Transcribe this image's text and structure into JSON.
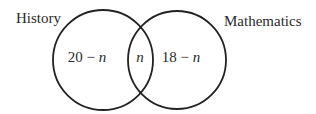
{
  "diagram": {
    "type": "venn",
    "sets": [
      {
        "name": "History",
        "only_region": "20 − n"
      },
      {
        "name": "Mathematics",
        "only_region": "18 − n"
      }
    ],
    "intersection": "n",
    "labels": {
      "history": "History",
      "mathematics": "Mathematics"
    },
    "regions": {
      "history_only_num": "20 − ",
      "history_only_var": "n",
      "intersection_var": "n",
      "math_only_num": "18 − ",
      "math_only_var": "n"
    },
    "colors": {
      "stroke": "#222222",
      "text": "#2a2a2a",
      "background": "#ffffff"
    }
  }
}
